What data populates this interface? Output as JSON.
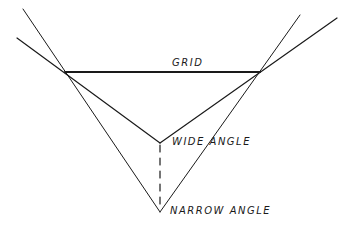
{
  "diagram": {
    "labels": {
      "grid": "GRID",
      "wide_angle": "WIDE ANGLE",
      "narrow_angle": "NARROW ANGLE"
    },
    "colors": {
      "stroke": "#1a1a1a",
      "background": "#ffffff"
    },
    "points": {
      "grid_left": [
        65,
        72
      ],
      "grid_right": [
        260,
        72
      ],
      "wide_apex": [
        160,
        143
      ],
      "narrow_apex": [
        160,
        212
      ]
    }
  }
}
